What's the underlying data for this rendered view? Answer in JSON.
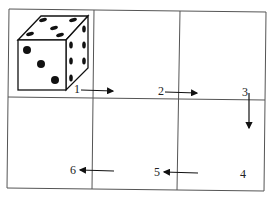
{
  "diagram": {
    "grid": {
      "rows": 2,
      "cols": 3
    },
    "die": {
      "top_face_pips": 5,
      "front_face_pips": 3,
      "right_face_pips": 6
    },
    "steps": [
      {
        "label": "1",
        "direction": "right"
      },
      {
        "label": "2",
        "direction": "right"
      },
      {
        "label": "3",
        "direction": "down"
      },
      {
        "label": "4",
        "direction": "none"
      },
      {
        "label": "5",
        "direction": "left"
      },
      {
        "label": "6",
        "direction": "left"
      }
    ]
  }
}
